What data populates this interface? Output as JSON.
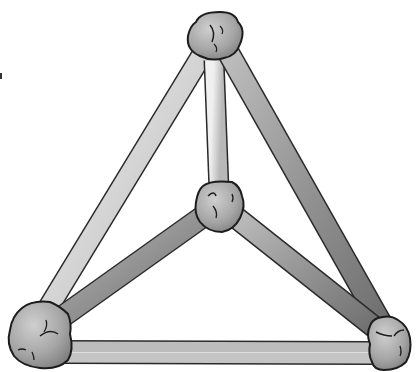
{
  "diagram": {
    "type": "tetrahedron-ball-and-stick-model",
    "nodes": [
      {
        "id": "top",
        "x": 215,
        "y": 42
      },
      {
        "id": "center",
        "x": 219,
        "y": 205
      },
      {
        "id": "bottom-left",
        "x": 40,
        "y": 335
      },
      {
        "id": "bottom-right",
        "x": 390,
        "y": 345
      }
    ],
    "edges": [
      {
        "id": "top-bottom-left",
        "from": "top",
        "to": "bottom-left",
        "shade": "light"
      },
      {
        "id": "top-bottom-right",
        "from": "top",
        "to": "bottom-right",
        "shade": "dark"
      },
      {
        "id": "top-center",
        "from": "top",
        "to": "center",
        "shade": "light"
      },
      {
        "id": "center-bottom-left",
        "from": "center",
        "to": "bottom-left",
        "shade": "dark"
      },
      {
        "id": "center-bottom-right",
        "from": "center",
        "to": "bottom-right",
        "shade": "dark"
      },
      {
        "id": "bottom-left-bottom-right",
        "from": "bottom-left",
        "to": "bottom-right",
        "shade": "light"
      }
    ],
    "colors": {
      "background": "#ffffff",
      "rod_light": "#d8d8d8",
      "rod_dark": "#9a9a9a",
      "node_fill": "#a8a8a8",
      "outline": "#222222"
    }
  }
}
